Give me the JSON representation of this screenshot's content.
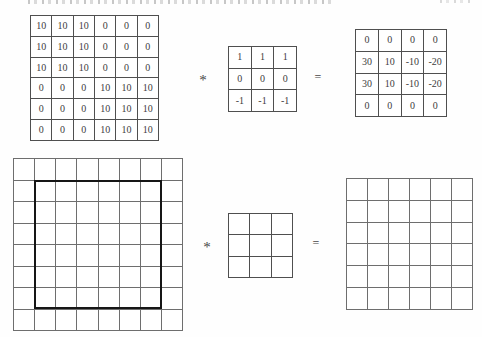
{
  "colors": {
    "bg": "#fefefe",
    "line": "#4f4f4f",
    "line_light": "#6e6e6e",
    "bold_line": "#161616",
    "text": "#3d3d3d"
  },
  "top_row": {
    "input_matrix": {
      "rows": 6,
      "cols": 6,
      "values": [
        [
          "10",
          "10",
          "10",
          "0",
          "0",
          "0"
        ],
        [
          "10",
          "10",
          "10",
          "0",
          "0",
          "0"
        ],
        [
          "10",
          "10",
          "10",
          "0",
          "0",
          "0"
        ],
        [
          "0",
          "0",
          "0",
          "10",
          "10",
          "10"
        ],
        [
          "0",
          "0",
          "0",
          "10",
          "10",
          "10"
        ],
        [
          "0",
          "0",
          "0",
          "10",
          "10",
          "10"
        ]
      ]
    },
    "operator": "*",
    "kernel_matrix": {
      "rows": 3,
      "cols": 3,
      "values": [
        [
          "1",
          "1",
          "1"
        ],
        [
          "0",
          "0",
          "0"
        ],
        [
          "-1",
          "-1",
          "-1"
        ]
      ]
    },
    "equals": "=",
    "output_matrix": {
      "rows": 4,
      "cols": 4,
      "values": [
        [
          "0",
          "0",
          "0",
          "0"
        ],
        [
          "30",
          "10",
          "-10",
          "-20"
        ],
        [
          "30",
          "10",
          "-10",
          "-20"
        ],
        [
          "0",
          "0",
          "0",
          "0"
        ]
      ]
    }
  },
  "bottom_row": {
    "input_grid": {
      "rows": 8,
      "cols": 8
    },
    "operator": "*",
    "kernel_grid": {
      "rows": 3,
      "cols": 3
    },
    "equals": "=",
    "output_grid": {
      "rows": 6,
      "cols": 6
    }
  }
}
